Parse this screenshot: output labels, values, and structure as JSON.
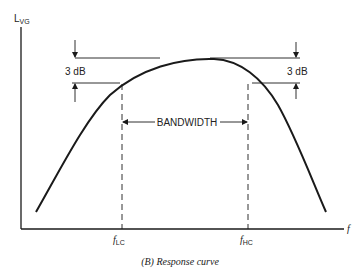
{
  "figure": {
    "caption": "(B) Response curve",
    "y_axis": {
      "label_main": "L",
      "label_sub": "VG"
    },
    "x_axis": {
      "label": "f"
    },
    "markers": [
      {
        "label_main": "f",
        "label_sub": "LC"
      },
      {
        "label_main": "f",
        "label_sub": "HC"
      }
    ],
    "annotations": {
      "left_db": "3 dB",
      "right_db": "3 dB",
      "bandwidth": "BANDWIDTH"
    },
    "colors": {
      "line": "#1a1a1a",
      "text": "#222222",
      "background": "#ffffff"
    }
  }
}
